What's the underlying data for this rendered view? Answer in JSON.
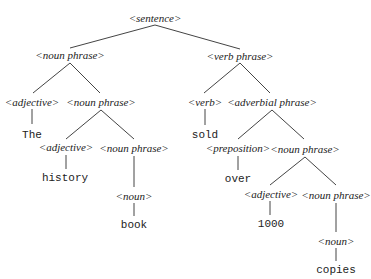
{
  "diagram": {
    "type": "parse-tree",
    "line_color": "#444444",
    "nodes": [
      {
        "id": "n0",
        "label": "<sentence>",
        "kind": "nonterminal",
        "x": 155,
        "y": 18
      },
      {
        "id": "n1",
        "label": "<noun phrase>",
        "kind": "nonterminal",
        "x": 70,
        "y": 55
      },
      {
        "id": "n2",
        "label": "<verb phrase>",
        "kind": "nonterminal",
        "x": 240,
        "y": 56
      },
      {
        "id": "n3",
        "label": "<adjective>",
        "kind": "nonterminal",
        "x": 32,
        "y": 102
      },
      {
        "id": "n4",
        "label": "<noun phrase>",
        "kind": "nonterminal",
        "x": 101,
        "y": 102
      },
      {
        "id": "n5",
        "label": "<verb>",
        "kind": "nonterminal",
        "x": 205,
        "y": 102
      },
      {
        "id": "n6",
        "label": "<adverbial phrase>",
        "kind": "nonterminal",
        "x": 272,
        "y": 102
      },
      {
        "id": "n7",
        "label": "The",
        "kind": "terminal",
        "x": 32,
        "y": 135
      },
      {
        "id": "n8",
        "label": "sold",
        "kind": "terminal",
        "x": 205,
        "y": 135
      },
      {
        "id": "n9",
        "label": "<adjective>",
        "kind": "nonterminal",
        "x": 66,
        "y": 147
      },
      {
        "id": "n10",
        "label": "<noun phrase>",
        "kind": "nonterminal",
        "x": 134,
        "y": 148
      },
      {
        "id": "n11",
        "label": "<preposition>",
        "kind": "nonterminal",
        "x": 238,
        "y": 148
      },
      {
        "id": "n12",
        "label": "<noun phrase>",
        "kind": "nonterminal",
        "x": 305,
        "y": 149
      },
      {
        "id": "n13",
        "label": "history",
        "kind": "terminal",
        "x": 65,
        "y": 178
      },
      {
        "id": "n14",
        "label": "over",
        "kind": "terminal",
        "x": 238,
        "y": 179
      },
      {
        "id": "n15",
        "label": "<noun>",
        "kind": "nonterminal",
        "x": 134,
        "y": 196
      },
      {
        "id": "n16",
        "label": "<adjective>",
        "kind": "nonterminal",
        "x": 271,
        "y": 194
      },
      {
        "id": "n17",
        "label": "<noun phrase>",
        "kind": "nonterminal",
        "x": 336,
        "y": 195
      },
      {
        "id": "n18",
        "label": "book",
        "kind": "terminal",
        "x": 134,
        "y": 225
      },
      {
        "id": "n19",
        "label": "1000",
        "kind": "terminal",
        "x": 271,
        "y": 224
      },
      {
        "id": "n20",
        "label": "<noun>",
        "kind": "nonterminal",
        "x": 336,
        "y": 241
      },
      {
        "id": "n21",
        "label": "copies",
        "kind": "terminal",
        "x": 336,
        "y": 270
      }
    ],
    "edges": [
      {
        "from": "n0",
        "to": "n1",
        "x1": 155,
        "y1": 25,
        "x2": 70,
        "y2": 48
      },
      {
        "from": "n0",
        "to": "n2",
        "x1": 155,
        "y1": 25,
        "x2": 240,
        "y2": 49
      },
      {
        "from": "n1",
        "to": "n3",
        "x1": 70,
        "y1": 63,
        "x2": 33,
        "y2": 93
      },
      {
        "from": "n1",
        "to": "n4",
        "x1": 70,
        "y1": 63,
        "x2": 100,
        "y2": 93
      },
      {
        "from": "n2",
        "to": "n5",
        "x1": 240,
        "y1": 63,
        "x2": 204,
        "y2": 93
      },
      {
        "from": "n2",
        "to": "n6",
        "x1": 240,
        "y1": 63,
        "x2": 270,
        "y2": 93
      },
      {
        "from": "n3",
        "to": "n7",
        "x1": 32,
        "y1": 109,
        "x2": 32,
        "y2": 124
      },
      {
        "from": "n4",
        "to": "n9",
        "x1": 101,
        "y1": 110,
        "x2": 66,
        "y2": 139
      },
      {
        "from": "n4",
        "to": "n10",
        "x1": 101,
        "y1": 110,
        "x2": 134,
        "y2": 139
      },
      {
        "from": "n5",
        "to": "n8",
        "x1": 205,
        "y1": 109,
        "x2": 205,
        "y2": 125
      },
      {
        "from": "n6",
        "to": "n11",
        "x1": 272,
        "y1": 110,
        "x2": 238,
        "y2": 139
      },
      {
        "from": "n6",
        "to": "n12",
        "x1": 272,
        "y1": 110,
        "x2": 304,
        "y2": 139
      },
      {
        "from": "n9",
        "to": "n13",
        "x1": 66,
        "y1": 155,
        "x2": 66,
        "y2": 169
      },
      {
        "from": "n10",
        "to": "n15",
        "x1": 134,
        "y1": 156,
        "x2": 134,
        "y2": 187
      },
      {
        "from": "n11",
        "to": "n14",
        "x1": 238,
        "y1": 156,
        "x2": 238,
        "y2": 170
      },
      {
        "from": "n12",
        "to": "n16",
        "x1": 305,
        "y1": 157,
        "x2": 270,
        "y2": 185
      },
      {
        "from": "n12",
        "to": "n17",
        "x1": 305,
        "y1": 157,
        "x2": 336,
        "y2": 185
      },
      {
        "from": "n15",
        "to": "n18",
        "x1": 134,
        "y1": 203,
        "x2": 134,
        "y2": 216
      },
      {
        "from": "n16",
        "to": "n19",
        "x1": 270,
        "y1": 201,
        "x2": 270,
        "y2": 215
      },
      {
        "from": "n17",
        "to": "n20",
        "x1": 336,
        "y1": 203,
        "x2": 336,
        "y2": 232
      },
      {
        "from": "n20",
        "to": "n21",
        "x1": 336,
        "y1": 248,
        "x2": 336,
        "y2": 261
      }
    ]
  }
}
